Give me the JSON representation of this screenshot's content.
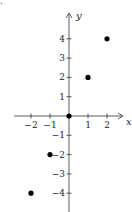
{
  "fragment": ".",
  "chart_data": {
    "type": "scatter",
    "title": "",
    "xlabel": "x",
    "ylabel": "y",
    "x": [
      -2,
      -1,
      0,
      1,
      2
    ],
    "y": [
      -4,
      -2,
      0,
      2,
      4
    ],
    "points": [
      [
        -2,
        -4
      ],
      [
        -1,
        -2
      ],
      [
        0,
        0
      ],
      [
        1,
        2
      ],
      [
        2,
        4
      ]
    ],
    "xticks": [
      "−2",
      "−1",
      "1",
      "2"
    ],
    "yticks": [
      "4",
      "3",
      "2",
      "1",
      "−1",
      "−2",
      "−3",
      "−4"
    ],
    "xlim": [
      -2.5,
      2.5
    ],
    "ylim": [
      -4.5,
      4.5
    ],
    "grid": false,
    "legend": null,
    "marker_color": "#000000"
  }
}
